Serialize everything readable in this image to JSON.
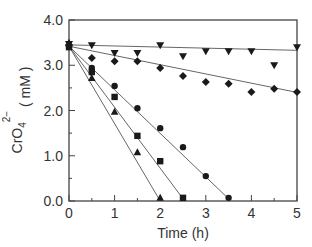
{
  "chart_data": {
    "type": "scatter",
    "title": "",
    "xlabel": "Time (h)",
    "ylabel": "CrO4 2- ( mM )",
    "ylabel_parts": {
      "base": "CrO",
      "sub": "4",
      "sup": "2−",
      "unit": "( mM )"
    },
    "xlim": [
      0,
      5
    ],
    "ylim": [
      0.0,
      4.0
    ],
    "x_ticks": [
      0,
      1,
      2,
      3,
      4,
      5
    ],
    "x_tick_labels": [
      "0",
      "1",
      "2",
      "3",
      "4",
      "5"
    ],
    "y_ticks": [
      0.0,
      1.0,
      2.0,
      3.0,
      4.0
    ],
    "y_tick_labels": [
      "0.0",
      "1.0",
      "2.0",
      "3.0",
      "4.0"
    ],
    "minor_x_ticks": [
      0.5,
      1.5,
      2.5,
      3.5,
      4.5
    ],
    "minor_y_ticks": [
      0.5,
      1.5,
      2.5,
      3.5
    ],
    "grid": false,
    "legend": null,
    "series": [
      {
        "name": "inverted-triangle",
        "marker": "triangle-down",
        "x": [
          0,
          0.5,
          1.0,
          1.5,
          2.0,
          2.5,
          3.0,
          3.5,
          4.0,
          4.5,
          5.0
        ],
        "y": [
          3.47,
          3.44,
          3.27,
          3.27,
          3.44,
          3.2,
          3.31,
          3.31,
          3.31,
          3.0,
          3.4
        ],
        "fit": {
          "x": [
            0,
            5
          ],
          "y": [
            3.45,
            3.33
          ]
        }
      },
      {
        "name": "diamond",
        "marker": "diamond",
        "x": [
          0,
          0.5,
          1.0,
          1.5,
          2.0,
          2.5,
          3.0,
          3.5,
          4.0,
          4.5,
          5.0
        ],
        "y": [
          3.45,
          3.16,
          3.09,
          3.09,
          2.94,
          2.76,
          2.63,
          2.59,
          2.41,
          2.48,
          2.41
        ],
        "fit": {
          "x": [
            0,
            5
          ],
          "y": [
            3.42,
            2.4
          ]
        }
      },
      {
        "name": "circle",
        "marker": "circle",
        "x": [
          0,
          0.5,
          1.0,
          1.5,
          2.0,
          2.5,
          3.0,
          3.5
        ],
        "y": [
          3.42,
          2.94,
          2.54,
          2.05,
          1.61,
          1.19,
          0.55,
          0.07
        ],
        "fit": {
          "x": [
            0,
            3.5
          ],
          "y": [
            3.42,
            0.05
          ]
        }
      },
      {
        "name": "square",
        "marker": "square",
        "x": [
          0,
          0.5,
          1.0,
          1.5,
          2.0,
          2.5
        ],
        "y": [
          3.4,
          2.85,
          2.3,
          1.44,
          0.88,
          0.07
        ],
        "fit": {
          "x": [
            0,
            2.5
          ],
          "y": [
            3.42,
            0.05
          ]
        }
      },
      {
        "name": "triangle-up",
        "marker": "triangle-up",
        "x": [
          0,
          0.5,
          1.0,
          1.5,
          2.0
        ],
        "y": [
          3.5,
          2.72,
          1.97,
          1.08,
          0.07
        ],
        "fit": {
          "x": [
            0,
            2.0
          ],
          "y": [
            3.42,
            0.0
          ]
        }
      }
    ]
  },
  "plot_area": {
    "left": 69,
    "top": 20,
    "right": 297,
    "bottom": 201
  },
  "colors": {
    "axis": "#444444",
    "marker": "#1a1a1a",
    "fit_line": "#555555",
    "background": "#ffffff"
  }
}
